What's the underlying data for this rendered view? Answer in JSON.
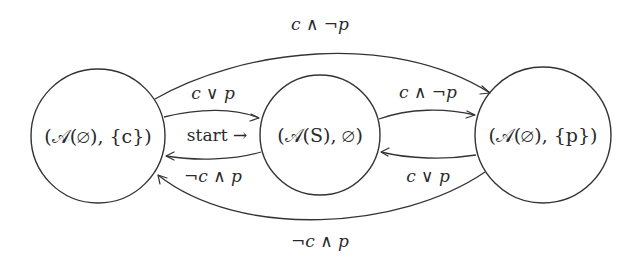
{
  "diagram": {
    "type": "state-machine",
    "colors": {
      "stroke": "#333333",
      "text": "#2a2a2a",
      "background": "#ffffff"
    },
    "nodes": [
      {
        "id": "left",
        "label": "(𝒜(∅), {c})",
        "cx": 98,
        "cy": 136,
        "r": 67
      },
      {
        "id": "middle",
        "label": "(𝒜(S), ∅)",
        "cx": 320,
        "cy": 135,
        "r": 60
      },
      {
        "id": "right",
        "label": "(𝒜(∅), {p})",
        "cx": 543,
        "cy": 135,
        "r": 68
      }
    ],
    "edges": [
      {
        "id": "left-to-right-top",
        "from": "left",
        "to": "right",
        "label": "c ∧ ¬p"
      },
      {
        "id": "left-to-middle",
        "from": "left",
        "to": "middle",
        "label": "c ∨ p"
      },
      {
        "id": "middle-to-right",
        "from": "middle",
        "to": "right",
        "label": "c ∧ ¬p"
      },
      {
        "id": "middle-to-left",
        "from": "middle",
        "to": "left",
        "label": "¬c ∧ p"
      },
      {
        "id": "right-to-middle",
        "from": "right",
        "to": "middle",
        "label": "c ∨ p"
      },
      {
        "id": "right-to-left-bottom",
        "from": "right",
        "to": "left",
        "label": "¬c ∧ p"
      }
    ],
    "start": {
      "target": "middle",
      "label": "start →"
    }
  }
}
